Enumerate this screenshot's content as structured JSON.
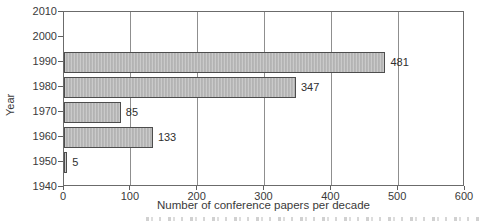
{
  "chart_data": {
    "type": "bar",
    "orientation": "horizontal",
    "title": "",
    "xlabel": "Number of conference papers per decade",
    "ylabel": "Year",
    "categories": [
      "1990",
      "1980",
      "1970",
      "1960",
      "1950"
    ],
    "values": [
      481,
      347,
      85,
      133,
      5
    ],
    "bar_labels": [
      "481",
      "347",
      "85",
      "133",
      "5"
    ],
    "xlim": [
      0,
      600
    ],
    "x_ticks": [
      0,
      100,
      200,
      300,
      400,
      500,
      600
    ],
    "y_ticks": [
      "2010",
      "2000",
      "1990",
      "1980",
      "1970",
      "1960",
      "1950",
      "1940"
    ],
    "grid": "vertical-major-only",
    "legend": "none",
    "colors": {
      "bar_fill": "#b8b8b8",
      "bar_border": "#4d4d4d",
      "plot_frame": "#6b6b6b",
      "gridline": "#8f8f8f",
      "text": "#3a3a3a",
      "background": "#ffffff"
    }
  },
  "annotations": {
    "bottom_cropped_text": "(illegible caption edge cut off at bottom of image)"
  }
}
